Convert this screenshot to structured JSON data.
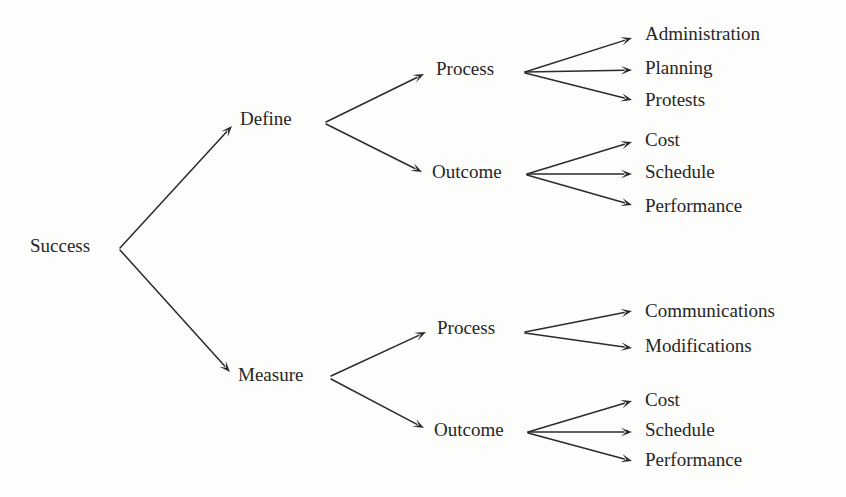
{
  "diagram": {
    "type": "tree",
    "title": "Success",
    "orientation": "left-to-right",
    "colors": {
      "text": "#262626",
      "line": "#2b2b2b",
      "background": "#fdfdfc"
    },
    "nodes": {
      "root": {
        "label": "Success",
        "x": 30,
        "y": 248
      },
      "define": {
        "label": "Define",
        "x": 240,
        "y": 121
      },
      "measure": {
        "label": "Measure",
        "x": 238,
        "y": 377
      },
      "define_process": {
        "label": "Process",
        "x": 436,
        "y": 71
      },
      "define_outcome": {
        "label": "Outcome",
        "x": 432,
        "y": 174
      },
      "measure_process": {
        "label": "Process",
        "x": 437,
        "y": 330
      },
      "measure_outcome": {
        "label": "Outcome",
        "x": 434,
        "y": 432
      },
      "leaf_administration": {
        "label": "Administration",
        "x": 645,
        "y": 36
      },
      "leaf_planning": {
        "label": "Planning",
        "x": 645,
        "y": 70
      },
      "leaf_protests": {
        "label": "Protests",
        "x": 645,
        "y": 102
      },
      "leaf_cost_1": {
        "label": "Cost",
        "x": 645,
        "y": 142
      },
      "leaf_schedule_1": {
        "label": "Schedule",
        "x": 645,
        "y": 174
      },
      "leaf_performance_1": {
        "label": "Performance",
        "x": 645,
        "y": 208
      },
      "leaf_communications": {
        "label": "Communications",
        "x": 645,
        "y": 313
      },
      "leaf_modifications": {
        "label": "Modifications",
        "x": 645,
        "y": 348
      },
      "leaf_cost_2": {
        "label": "Cost",
        "x": 645,
        "y": 402
      },
      "leaf_schedule_2": {
        "label": "Schedule",
        "x": 645,
        "y": 432
      },
      "leaf_performance_2": {
        "label": "Performance",
        "x": 645,
        "y": 462
      }
    },
    "edges": [
      {
        "name": "success-to-define",
        "from": "Success",
        "to": "Define",
        "x1": 120,
        "y1": 248,
        "x2": 232,
        "y2": 126
      },
      {
        "name": "success-to-measure",
        "from": "Success",
        "to": "Measure",
        "x1": 120,
        "y1": 250,
        "x2": 230,
        "y2": 372
      },
      {
        "name": "define-to-process",
        "from": "Define",
        "to": "Process",
        "x1": 326,
        "y1": 122,
        "x2": 424,
        "y2": 74
      },
      {
        "name": "define-to-outcome",
        "from": "Define",
        "to": "Outcome",
        "x1": 326,
        "y1": 124,
        "x2": 422,
        "y2": 172
      },
      {
        "name": "measure-to-process",
        "from": "Measure",
        "to": "Process",
        "x1": 331,
        "y1": 376,
        "x2": 426,
        "y2": 332
      },
      {
        "name": "measure-to-outcome",
        "from": "Measure",
        "to": "Outcome",
        "x1": 331,
        "y1": 379,
        "x2": 424,
        "y2": 428
      },
      {
        "name": "process-to-administration",
        "from": "Process",
        "to": "Administration",
        "x1": 525,
        "y1": 72,
        "x2": 632,
        "y2": 38
      },
      {
        "name": "process-to-planning",
        "from": "Process",
        "to": "Planning",
        "x1": 525,
        "y1": 72,
        "x2": 632,
        "y2": 70
      },
      {
        "name": "process-to-protests",
        "from": "Process",
        "to": "Protests",
        "x1": 525,
        "y1": 73,
        "x2": 632,
        "y2": 100
      },
      {
        "name": "outcome-to-cost-1",
        "from": "Outcome",
        "to": "Cost",
        "x1": 527,
        "y1": 174,
        "x2": 632,
        "y2": 142
      },
      {
        "name": "outcome-to-schedule-1",
        "from": "Outcome",
        "to": "Schedule",
        "x1": 527,
        "y1": 174,
        "x2": 632,
        "y2": 174
      },
      {
        "name": "outcome-to-performance-1",
        "from": "Outcome",
        "to": "Performance",
        "x1": 527,
        "y1": 175,
        "x2": 632,
        "y2": 205
      },
      {
        "name": "process-to-communications",
        "from": "Process",
        "to": "Communications",
        "x1": 525,
        "y1": 332,
        "x2": 632,
        "y2": 311
      },
      {
        "name": "process-to-modifications",
        "from": "Process",
        "to": "Modifications",
        "x1": 525,
        "y1": 333,
        "x2": 632,
        "y2": 348
      },
      {
        "name": "outcome-to-cost-2",
        "from": "Outcome",
        "to": "Cost",
        "x1": 528,
        "y1": 432,
        "x2": 632,
        "y2": 401
      },
      {
        "name": "outcome-to-schedule-2",
        "from": "Outcome",
        "to": "Schedule",
        "x1": 528,
        "y1": 432,
        "x2": 632,
        "y2": 432
      },
      {
        "name": "outcome-to-performance-2",
        "from": "Outcome",
        "to": "Performance",
        "x1": 528,
        "y1": 433,
        "x2": 632,
        "y2": 461
      }
    ]
  }
}
